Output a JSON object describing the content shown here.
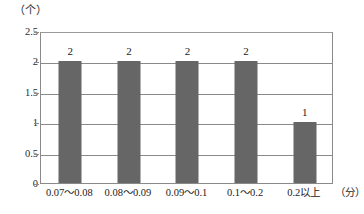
{
  "chart_data": {
    "type": "bar",
    "title": "",
    "subtitle": "",
    "categories": [
      "0.07～0.08",
      "0.08～0.09",
      "0.09～0.1",
      "0.1～0.2",
      "0.2以上"
    ],
    "values": [
      2,
      2,
      2,
      2,
      1
    ],
    "value_labels": [
      "2",
      "2",
      "2",
      "2",
      "1"
    ],
    "xlabel": "（分）",
    "ylabel": "（个）",
    "ylim": [
      0,
      2.5
    ],
    "ytick_values": [
      0,
      0.5,
      1,
      1.5,
      2,
      2.5
    ],
    "ytick_labels": [
      "0",
      "0.5",
      "1",
      "1.5",
      "2",
      "2.5"
    ],
    "grid": "horizontal",
    "legend": "none",
    "bar_color": "#666666",
    "gridline_color": "#8a8a8a",
    "axis_color": "#8a8a8a",
    "background_color": "#ffffff"
  }
}
